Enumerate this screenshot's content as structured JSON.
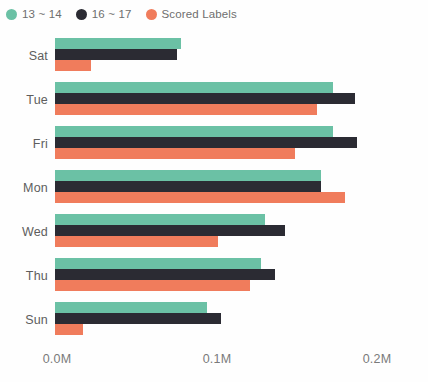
{
  "legend": {
    "position": "top-left",
    "entries": [
      {
        "label": "13 ~ 14",
        "color": "#6BC1A5",
        "marker": "circle-marker-icon"
      },
      {
        "label": "16 ~ 17",
        "color": "#2B2B33",
        "marker": "circle-marker-icon"
      },
      {
        "label": "Scored Labels",
        "color": "#F07C5C",
        "marker": "circle-marker-icon"
      }
    ]
  },
  "axis": {
    "x_tick_labels": [
      "0.0M",
      "0.1M",
      "0.2M"
    ],
    "x_tick_values": [
      0,
      100000,
      200000
    ]
  },
  "chart_data": {
    "type": "bar",
    "orientation": "horizontal",
    "title": "",
    "subtitle": "",
    "xlabel": "",
    "ylabel": "",
    "grid": false,
    "legend_position": "top-left",
    "xlim": [
      0,
      200000
    ],
    "x_ticks": [
      0,
      100000,
      200000
    ],
    "x_tick_labels": [
      "0.0M",
      "0.1M",
      "0.2M"
    ],
    "categories": [
      "Sat",
      "Tue",
      "Fri",
      "Mon",
      "Wed",
      "Thu",
      "Sun"
    ],
    "series": [
      {
        "name": "13 ~ 14",
        "color": "#6BC1A5",
        "values": [
          79000,
          174000,
          174000,
          166000,
          131000,
          129000,
          95000
        ]
      },
      {
        "name": "16 ~ 17",
        "color": "#2B2B33",
        "values": [
          76000,
          187500,
          189000,
          166000,
          144000,
          137500,
          104000
        ]
      },
      {
        "name": "Scored Labels",
        "color": "#F07C5C",
        "values": [
          22500,
          164000,
          150000,
          181000,
          102000,
          122000,
          17500
        ]
      }
    ]
  }
}
